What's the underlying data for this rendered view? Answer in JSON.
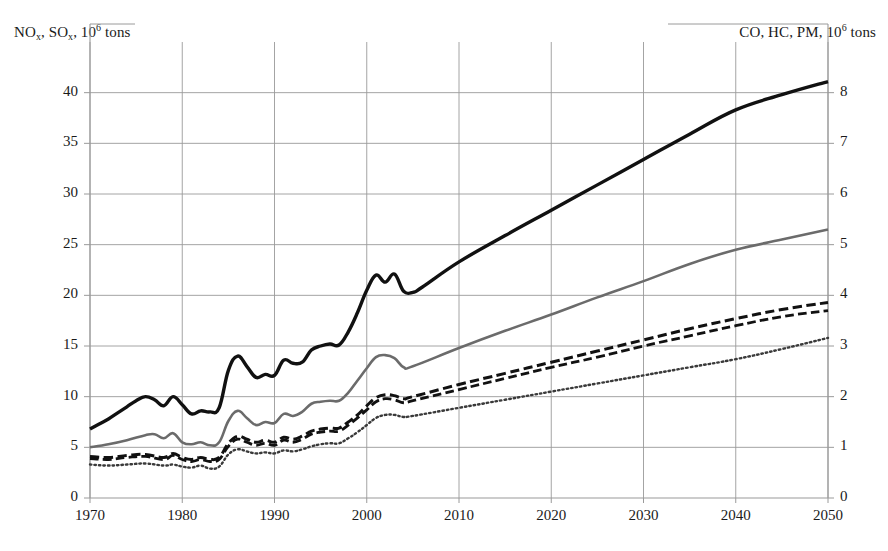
{
  "chart_data": {
    "type": "line",
    "title": "",
    "subtitle": "",
    "xlabel": "",
    "ylabel": "NOₓ, SOₓ, 10⁶ tons",
    "ylabel_right": "CO, HC, PM, 10⁶ tons",
    "xlim": [
      1970,
      2050
    ],
    "ylim": [
      0,
      45
    ],
    "ylim_right": [
      0,
      9
    ],
    "grid": true,
    "legend": "none",
    "xticks": [
      1970,
      1980,
      1990,
      2000,
      2010,
      2020,
      2030,
      2040,
      2050
    ],
    "yticks_left": [
      0,
      5,
      10,
      15,
      20,
      25,
      30,
      35,
      40
    ],
    "yticks_right": [
      0,
      1,
      2,
      3,
      4,
      5,
      6,
      7,
      8
    ],
    "axis_titles": {
      "left_main": "NO",
      "left_sub1": "x",
      "left_mid": ", SO",
      "left_sub2": "x",
      "left_unit": ", 10",
      "left_sup": "6",
      "left_tail": " tons",
      "right_main": "CO, HC, PM, 10",
      "right_sup": "6",
      "right_tail": " tons"
    },
    "series": [
      {
        "name": "black-solid-thick",
        "style": "solid",
        "color": "#111111",
        "width": 3.4,
        "axis": "left",
        "points": [
          [
            1970,
            6.8
          ],
          [
            1971,
            7.3
          ],
          [
            1972,
            7.8
          ],
          [
            1973,
            8.4
          ],
          [
            1974,
            9.0
          ],
          [
            1975,
            9.6
          ],
          [
            1976,
            10.0
          ],
          [
            1977,
            9.7
          ],
          [
            1978,
            9.1
          ],
          [
            1979,
            10.0
          ],
          [
            1980,
            9.2
          ],
          [
            1981,
            8.3
          ],
          [
            1982,
            8.6
          ],
          [
            1983,
            8.5
          ],
          [
            1984,
            8.9
          ],
          [
            1985,
            12.6
          ],
          [
            1986,
            14.0
          ],
          [
            1987,
            13.0
          ],
          [
            1988,
            11.9
          ],
          [
            1989,
            12.2
          ],
          [
            1990,
            12.1
          ],
          [
            1991,
            13.6
          ],
          [
            1992,
            13.3
          ],
          [
            1993,
            13.4
          ],
          [
            1994,
            14.6
          ],
          [
            1995,
            15.0
          ],
          [
            1996,
            15.2
          ],
          [
            1997,
            15.1
          ],
          [
            1998,
            16.4
          ],
          [
            1999,
            18.3
          ],
          [
            2000,
            20.5
          ],
          [
            2001,
            22.0
          ],
          [
            2002,
            21.3
          ],
          [
            2003,
            22.1
          ],
          [
            2004,
            20.4
          ],
          [
            2005,
            20.3
          ],
          [
            2006,
            20.8
          ],
          [
            2010,
            23.3
          ],
          [
            2015,
            25.9
          ],
          [
            2020,
            28.4
          ],
          [
            2025,
            30.9
          ],
          [
            2030,
            33.4
          ],
          [
            2035,
            35.9
          ],
          [
            2040,
            38.3
          ],
          [
            2045,
            39.8
          ],
          [
            2050,
            41.1
          ]
        ]
      },
      {
        "name": "gray-solid",
        "style": "solid",
        "color": "#6b6b6b",
        "width": 2.6,
        "axis": "left",
        "points": [
          [
            1970,
            5.0
          ],
          [
            1972,
            5.3
          ],
          [
            1974,
            5.7
          ],
          [
            1976,
            6.2
          ],
          [
            1977,
            6.3
          ],
          [
            1978,
            5.9
          ],
          [
            1979,
            6.4
          ],
          [
            1980,
            5.5
          ],
          [
            1981,
            5.3
          ],
          [
            1982,
            5.5
          ],
          [
            1983,
            5.2
          ],
          [
            1984,
            5.5
          ],
          [
            1985,
            7.6
          ],
          [
            1986,
            8.6
          ],
          [
            1987,
            7.9
          ],
          [
            1988,
            7.2
          ],
          [
            1989,
            7.5
          ],
          [
            1990,
            7.4
          ],
          [
            1991,
            8.3
          ],
          [
            1992,
            8.1
          ],
          [
            1993,
            8.5
          ],
          [
            1994,
            9.3
          ],
          [
            1995,
            9.5
          ],
          [
            1996,
            9.6
          ],
          [
            1997,
            9.6
          ],
          [
            1998,
            10.4
          ],
          [
            1999,
            11.6
          ],
          [
            2000,
            12.8
          ],
          [
            2001,
            13.9
          ],
          [
            2002,
            14.1
          ],
          [
            2003,
            13.8
          ],
          [
            2004,
            12.9
          ],
          [
            2005,
            13.0
          ],
          [
            2010,
            14.8
          ],
          [
            2015,
            16.5
          ],
          [
            2020,
            18.1
          ],
          [
            2025,
            19.8
          ],
          [
            2030,
            21.4
          ],
          [
            2035,
            23.1
          ],
          [
            2040,
            24.5
          ],
          [
            2045,
            25.5
          ],
          [
            2050,
            26.5
          ]
        ]
      },
      {
        "name": "black-dashed-upper",
        "style": "dashed",
        "color": "#111111",
        "width": 3.0,
        "axis": "left",
        "points": [
          [
            1970,
            4.1
          ],
          [
            1972,
            4.0
          ],
          [
            1974,
            4.2
          ],
          [
            1976,
            4.3
          ],
          [
            1978,
            4.0
          ],
          [
            1979,
            4.4
          ],
          [
            1980,
            4.0
          ],
          [
            1981,
            3.8
          ],
          [
            1982,
            4.0
          ],
          [
            1983,
            3.8
          ],
          [
            1984,
            4.0
          ],
          [
            1985,
            5.4
          ],
          [
            1986,
            6.1
          ],
          [
            1987,
            5.8
          ],
          [
            1988,
            5.5
          ],
          [
            1989,
            5.7
          ],
          [
            1990,
            5.5
          ],
          [
            1991,
            6.0
          ],
          [
            1992,
            5.8
          ],
          [
            1993,
            6.1
          ],
          [
            1994,
            6.6
          ],
          [
            1995,
            6.8
          ],
          [
            1996,
            6.9
          ],
          [
            1997,
            6.9
          ],
          [
            1998,
            7.5
          ],
          [
            1999,
            8.2
          ],
          [
            2000,
            9.1
          ],
          [
            2001,
            9.9
          ],
          [
            2002,
            10.2
          ],
          [
            2003,
            10.1
          ],
          [
            2004,
            9.8
          ],
          [
            2005,
            10.0
          ],
          [
            2010,
            11.2
          ],
          [
            2015,
            12.3
          ],
          [
            2020,
            13.4
          ],
          [
            2025,
            14.5
          ],
          [
            2030,
            15.6
          ],
          [
            2035,
            16.7
          ],
          [
            2040,
            17.7
          ],
          [
            2045,
            18.6
          ],
          [
            2050,
            19.3
          ]
        ]
      },
      {
        "name": "black-dashed-lower",
        "style": "dashed",
        "color": "#111111",
        "width": 2.8,
        "axis": "left",
        "points": [
          [
            1970,
            3.9
          ],
          [
            1972,
            3.8
          ],
          [
            1974,
            4.0
          ],
          [
            1976,
            4.1
          ],
          [
            1978,
            3.8
          ],
          [
            1979,
            4.2
          ],
          [
            1980,
            3.8
          ],
          [
            1981,
            3.6
          ],
          [
            1982,
            3.8
          ],
          [
            1983,
            3.6
          ],
          [
            1984,
            3.8
          ],
          [
            1985,
            5.1
          ],
          [
            1986,
            5.8
          ],
          [
            1987,
            5.5
          ],
          [
            1988,
            5.2
          ],
          [
            1989,
            5.4
          ],
          [
            1990,
            5.2
          ],
          [
            1991,
            5.7
          ],
          [
            1992,
            5.5
          ],
          [
            1993,
            5.8
          ],
          [
            1994,
            6.3
          ],
          [
            1995,
            6.5
          ],
          [
            1996,
            6.6
          ],
          [
            1997,
            6.6
          ],
          [
            1998,
            7.2
          ],
          [
            1999,
            7.9
          ],
          [
            2000,
            8.7
          ],
          [
            2001,
            9.5
          ],
          [
            2002,
            9.8
          ],
          [
            2003,
            9.7
          ],
          [
            2004,
            9.4
          ],
          [
            2005,
            9.6
          ],
          [
            2010,
            10.7
          ],
          [
            2015,
            11.8
          ],
          [
            2020,
            12.9
          ],
          [
            2025,
            13.9
          ],
          [
            2030,
            15.0
          ],
          [
            2035,
            16.0
          ],
          [
            2040,
            17.0
          ],
          [
            2045,
            17.9
          ],
          [
            2050,
            18.5
          ]
        ]
      },
      {
        "name": "dotted",
        "style": "dotted",
        "color": "#3a3a3a",
        "width": 2.4,
        "axis": "left",
        "points": [
          [
            1970,
            3.3
          ],
          [
            1972,
            3.2
          ],
          [
            1974,
            3.3
          ],
          [
            1976,
            3.4
          ],
          [
            1978,
            3.2
          ],
          [
            1979,
            3.3
          ],
          [
            1980,
            3.1
          ],
          [
            1981,
            3.0
          ],
          [
            1982,
            3.2
          ],
          [
            1983,
            2.9
          ],
          [
            1984,
            3.1
          ],
          [
            1985,
            4.3
          ],
          [
            1986,
            4.8
          ],
          [
            1987,
            4.6
          ],
          [
            1988,
            4.4
          ],
          [
            1989,
            4.5
          ],
          [
            1990,
            4.4
          ],
          [
            1991,
            4.7
          ],
          [
            1992,
            4.6
          ],
          [
            1993,
            4.8
          ],
          [
            1994,
            5.1
          ],
          [
            1995,
            5.3
          ],
          [
            1996,
            5.4
          ],
          [
            1997,
            5.4
          ],
          [
            1998,
            5.9
          ],
          [
            1999,
            6.5
          ],
          [
            2000,
            7.2
          ],
          [
            2001,
            7.9
          ],
          [
            2002,
            8.2
          ],
          [
            2003,
            8.2
          ],
          [
            2004,
            8.0
          ],
          [
            2005,
            8.1
          ],
          [
            2010,
            8.9
          ],
          [
            2015,
            9.7
          ],
          [
            2020,
            10.5
          ],
          [
            2025,
            11.3
          ],
          [
            2030,
            12.1
          ],
          [
            2035,
            12.9
          ],
          [
            2040,
            13.7
          ],
          [
            2045,
            14.7
          ],
          [
            2050,
            15.8
          ]
        ]
      }
    ]
  },
  "colors": {
    "grid": "#9a9a9a",
    "axis": "#707070",
    "black": "#111111",
    "gray": "#6b6b6b",
    "background": "#ffffff"
  }
}
